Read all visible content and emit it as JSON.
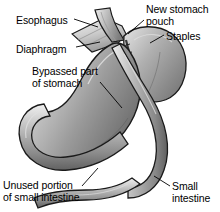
{
  "figure": {
    "background_color": "#ffffff",
    "ink_color": "#000000"
  },
  "labels": [
    {
      "key": "esophagus",
      "text": "Esophagus",
      "name": "label-esophagus",
      "x": 16,
      "y": 14,
      "align": "left"
    },
    {
      "key": "diaphragm",
      "text": "Diaphragm",
      "name": "label-diaphragm",
      "x": 16,
      "y": 43,
      "align": "left"
    },
    {
      "key": "bypassed_line1",
      "text": "Bypassed part",
      "name": "label-bypassed-part-line1",
      "x": 32,
      "y": 65,
      "align": "left"
    },
    {
      "key": "bypassed_line2",
      "text": "of stomach",
      "name": "label-bypassed-part-line2",
      "x": 32,
      "y": 77,
      "align": "left"
    },
    {
      "key": "new_pouch_line1",
      "text": "New stomach",
      "name": "label-new-stomach-pouch-line1",
      "x": 146,
      "y": 3,
      "align": "left"
    },
    {
      "key": "new_pouch_line2",
      "text": "pouch",
      "name": "label-new-stomach-pouch-line2",
      "x": 146,
      "y": 15,
      "align": "left"
    },
    {
      "key": "staples",
      "text": "Staples",
      "name": "label-staples",
      "x": 166,
      "y": 30,
      "align": "left"
    },
    {
      "key": "unused_line1",
      "text": "Unused portion",
      "name": "label-unused-portion-line1",
      "x": 3,
      "y": 179,
      "align": "left"
    },
    {
      "key": "unused_line2",
      "text": "of small intestine",
      "name": "label-unused-portion-line2",
      "x": 3,
      "y": 191,
      "align": "left"
    },
    {
      "key": "small_intestine_line1",
      "text": "Small",
      "name": "label-small-intestine-line1",
      "x": 172,
      "y": 180,
      "align": "left"
    },
    {
      "key": "small_intestine_line2",
      "text": "intestine",
      "name": "label-small-intestine-line2",
      "x": 172,
      "y": 192,
      "align": "left"
    }
  ],
  "anatomy_parts": [
    {
      "key": "esophagus",
      "name": "esophagus-tube"
    },
    {
      "key": "diaphragm",
      "name": "diaphragm-band"
    },
    {
      "key": "gastric_pouch",
      "name": "new-stomach-pouch"
    },
    {
      "key": "staple_line",
      "name": "staple-line"
    },
    {
      "key": "bypassed_stomach",
      "name": "bypassed-stomach-body"
    },
    {
      "key": "duodenum",
      "name": "duodenum-loop"
    },
    {
      "key": "roux_limb",
      "name": "roux-limb-small-intestine"
    },
    {
      "key": "unused_limb",
      "name": "unused-small-intestine-limb"
    }
  ],
  "palette": {
    "outline": "#1a1a1a",
    "tissue_light": "#e8e8e8",
    "tissue_mid": "#a6a6a6",
    "tissue_dark": "#6f6f6f",
    "tissue_shadow": "#555555",
    "highlight": "#f4f4f4"
  }
}
